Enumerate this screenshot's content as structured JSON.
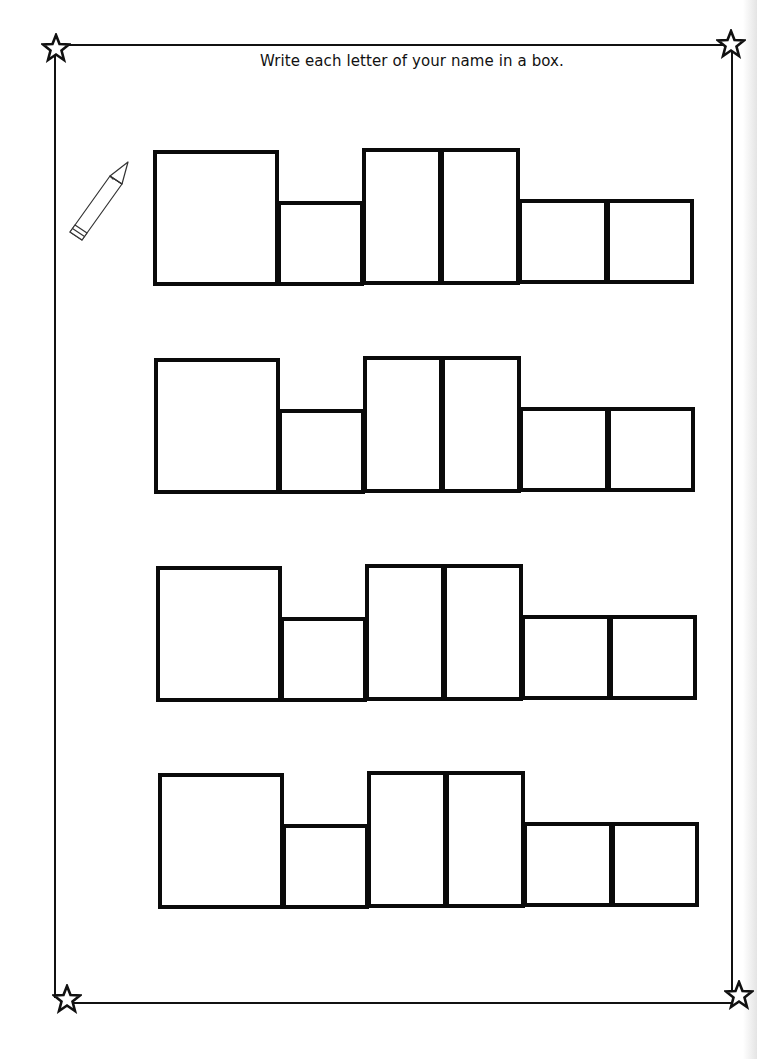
{
  "worksheet": {
    "instruction": "Write each letter of your name in a box.",
    "decorations": {
      "corner_icon": "star-outline-icon",
      "side_icon": "pencil-icon"
    },
    "colors": {
      "ink": "#0a0a0a",
      "paper": "#ffffff"
    },
    "box_rows": [
      {
        "offset": [
          0,
          0
        ],
        "boxes": [
          {
            "x": 153,
            "y": 150,
            "w": 126,
            "h": 136
          },
          {
            "x": 277,
            "y": 201,
            "w": 87,
            "h": 85
          },
          {
            "x": 362,
            "y": 148,
            "w": 80,
            "h": 137
          },
          {
            "x": 440,
            "y": 148,
            "w": 80,
            "h": 137
          },
          {
            "x": 518,
            "y": 199,
            "w": 90,
            "h": 85
          },
          {
            "x": 606,
            "y": 199,
            "w": 88,
            "h": 85
          }
        ]
      },
      {
        "offset": [
          1,
          208
        ],
        "boxes": []
      },
      {
        "offset": [
          3,
          416
        ],
        "boxes": []
      },
      {
        "offset": [
          5,
          623
        ],
        "boxes": []
      }
    ],
    "letters_per_row": 6,
    "row_count": 4
  }
}
